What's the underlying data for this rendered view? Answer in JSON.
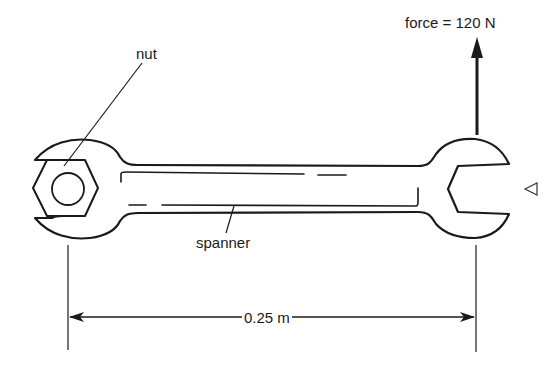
{
  "diagram": {
    "labels": {
      "force": "force = 120 N",
      "nut": "nut",
      "spanner": "spanner",
      "distance": "0.25 m"
    },
    "values": {
      "force_newtons": 120,
      "distance_metres": 0.25
    },
    "colors": {
      "stroke": "#1a1a1a",
      "background": "#ffffff"
    },
    "icons": {
      "force_arrow": "arrow-up-icon",
      "dimension_arrow": "double-headed-arrow-icon",
      "side_marker": "triangle-left-icon"
    }
  }
}
